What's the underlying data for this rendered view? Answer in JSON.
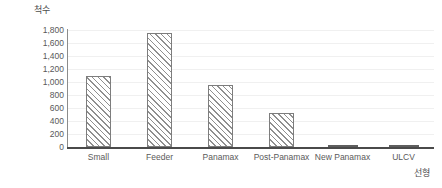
{
  "chart_data": {
    "type": "bar",
    "title": "척수",
    "xlabel": "선형",
    "ylabel": "척수",
    "categories": [
      "Small",
      "Feeder",
      "Panamax",
      "Post-Panamax",
      "New Panamax",
      "ULCV"
    ],
    "values": [
      1100,
      1750,
      950,
      520,
      20,
      15
    ],
    "ylim": [
      0,
      1800
    ],
    "ytick_step": 200,
    "ytick_labels": [
      "1,800",
      "1,600",
      "1,400",
      "1,200",
      "1,000",
      "800",
      "600",
      "400",
      "200",
      "0"
    ],
    "ytick_values": [
      1800,
      1600,
      1400,
      1200,
      1000,
      800,
      600,
      400,
      200,
      0
    ],
    "grid": true,
    "legend": false,
    "series_name": "척수",
    "bar_fill": "#ffffff",
    "bar_hatch": "diagonal-45",
    "bar_edge_color": "#7d7d7d",
    "gridline_color": "#f0f0f0",
    "axis_color": "#4a4a4a",
    "text_color": "#5a5a5a"
  }
}
